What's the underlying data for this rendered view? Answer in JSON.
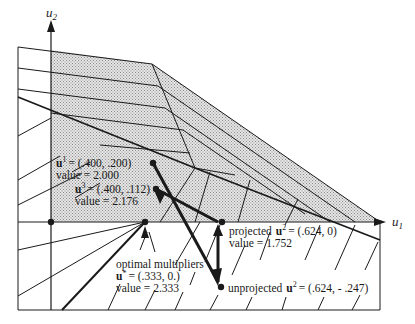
{
  "axes": {
    "x_label": "u",
    "x_sub": "1",
    "y_label": "u",
    "y_sub": "2"
  },
  "points": {
    "u1": {
      "name": "u",
      "sup": "1",
      "coords": "= (.400, .200)",
      "value": "value = 2.000"
    },
    "u3": {
      "name": "u",
      "sup": "3",
      "coords": "= (.400, .112)",
      "value": "value = 2.176"
    },
    "optimal": {
      "title": "optimal multipliers",
      "name": "u",
      "sup": "*",
      "coords": "= (.333, 0.)",
      "value": "value = 2.333"
    },
    "projected_u2": {
      "prefix": "projected",
      "name": "u",
      "sup": "2",
      "coords": "= (.624, 0)",
      "value": "value = 1.752"
    },
    "unprojected_u2": {
      "prefix": "unprojected",
      "name": "u",
      "sup": "2",
      "coords": "= (.624, - .247)"
    }
  },
  "colors": {
    "ink": "#1a1a1a",
    "shade": "#c8c8c8",
    "background": "#ffffff"
  }
}
